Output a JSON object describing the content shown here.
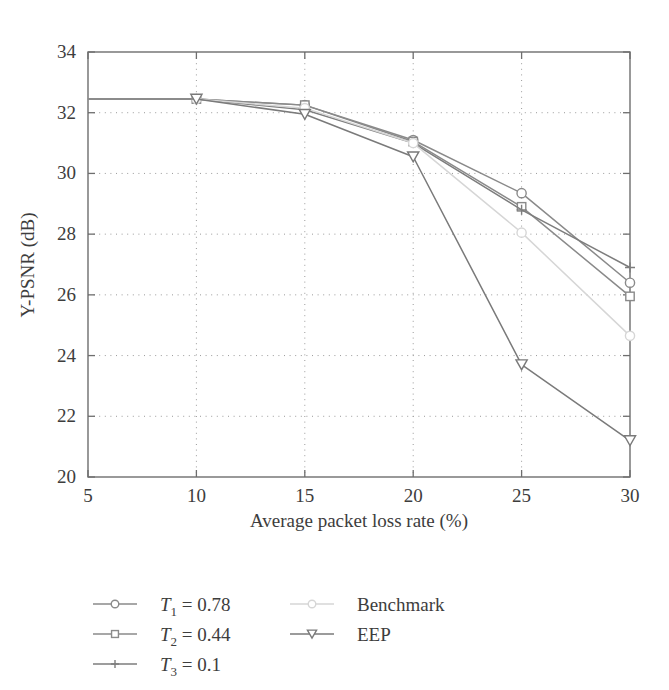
{
  "chart_data": {
    "type": "line",
    "title": "",
    "xlabel": "Average packet loss rate (%)",
    "ylabel": "Y-PSNR (dB)",
    "xlim": [
      5,
      30
    ],
    "ylim": [
      20,
      34
    ],
    "xticks": [
      5,
      10,
      15,
      20,
      25,
      30
    ],
    "yticks": [
      20,
      22,
      24,
      26,
      28,
      30,
      32,
      34
    ],
    "grid": true,
    "legend_position": "below-left",
    "x": [
      5,
      10,
      15,
      20,
      25,
      30
    ],
    "series": [
      {
        "name": "T1 = 0.78",
        "marker": "circle",
        "color": "#8a8a8a",
        "values": [
          32.45,
          32.45,
          32.25,
          31.1,
          29.35,
          26.4
        ]
      },
      {
        "name": "T2 = 0.44",
        "marker": "square",
        "color": "#8a8a8a",
        "values": [
          32.45,
          32.45,
          32.25,
          31.05,
          28.9,
          25.95
        ]
      },
      {
        "name": "T3 = 0.1",
        "marker": "plus",
        "color": "#7d7d7d",
        "values": [
          32.45,
          32.45,
          32.1,
          31.0,
          28.8,
          26.9
        ]
      },
      {
        "name": "Benchmark",
        "marker": "circle-light",
        "color": "#d6d6d6",
        "values": [
          32.45,
          32.45,
          32.15,
          31.0,
          28.05,
          24.65
        ]
      },
      {
        "name": "EEP",
        "marker": "triangle-down",
        "color": "#7a7a7a",
        "values": [
          32.45,
          32.45,
          31.95,
          30.55,
          23.7,
          21.2
        ]
      }
    ]
  },
  "axes": {
    "x_tick_labels": [
      "5",
      "10",
      "15",
      "20",
      "25",
      "30"
    ],
    "y_tick_labels": [
      "20",
      "22",
      "24",
      "26",
      "28",
      "30",
      "32",
      "34"
    ],
    "x_axis_title": "Average packet loss rate (%)",
    "y_axis_title": "Y-PSNR (dB)"
  },
  "legend": {
    "column_left": [
      {
        "base": "T",
        "sub": "1",
        "rest": " = 0.78",
        "marker": "circle-icon",
        "color": "#8a8a8a"
      },
      {
        "base": "T",
        "sub": "2",
        "rest": " = 0.44",
        "marker": "square-icon",
        "color": "#8a8a8a"
      },
      {
        "base": "T",
        "sub": "3",
        "rest": " = 0.1",
        "marker": "plus-icon",
        "color": "#7d7d7d"
      }
    ],
    "column_right": [
      {
        "label": "Benchmark",
        "marker": "circle-light-icon",
        "color": "#d6d6d6"
      },
      {
        "label": "EEP",
        "marker": "triangle-down-icon",
        "color": "#7a7a7a"
      }
    ]
  },
  "colors": {
    "frame": "#6e6e6e",
    "grid": "#9a9a9a",
    "text": "#3d3d3d",
    "benchmark": "#d6d6d6",
    "series_gray": "#8a8a8a",
    "background": "#ffffff"
  }
}
